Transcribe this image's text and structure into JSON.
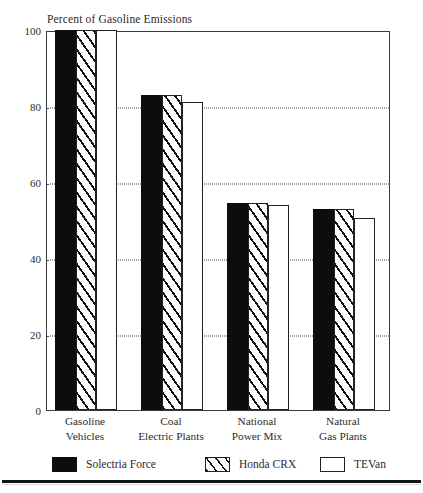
{
  "chart_data": {
    "type": "bar",
    "title": "Percent of Gasoline Emissions",
    "xlabel": "",
    "ylabel": "",
    "ylim": [
      0,
      100
    ],
    "yticks": [
      0,
      20,
      40,
      60,
      80,
      100
    ],
    "grid": "horizontal-dotted",
    "legend_position": "below-axes",
    "categories": [
      "Gasoline\nVehicles",
      "Coal\nElectric Plants",
      "National\nPower Mix",
      "Natural\nGas Plants"
    ],
    "category_lines": [
      [
        "Gasoline",
        "Vehicles"
      ],
      [
        "Coal",
        "Electric Plants"
      ],
      [
        "National",
        "Power Mix"
      ],
      [
        "Natural",
        "Gas Plants"
      ]
    ],
    "series": [
      {
        "name": "Solectria Force",
        "fill": "solid",
        "values": [
          100,
          83,
          54.5,
          53
        ]
      },
      {
        "name": "Honda CRX",
        "fill": "hatch",
        "values": [
          100,
          83,
          54.5,
          53
        ]
      },
      {
        "name": "TEVan",
        "fill": "open",
        "values": [
          100,
          81,
          54,
          50.5
        ]
      }
    ]
  },
  "axis": {
    "y_tick_labels": [
      "0",
      "20",
      "40",
      "60",
      "80",
      "100"
    ]
  },
  "legend": {
    "items": [
      {
        "label": "Solectria Force"
      },
      {
        "label": "Honda CRX"
      },
      {
        "label": "TEVan"
      }
    ]
  },
  "colors": {
    "solid_fill": "#0d0d0d",
    "hatch_line": "#111111",
    "open_fill": "#ffffff",
    "frame": "#3a3a3a",
    "gridline": "#4a4a4a",
    "text": "#2b2b2b",
    "rule": "#141414"
  }
}
